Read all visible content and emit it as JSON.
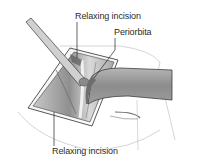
{
  "figure": {
    "type": "surgical-illustration",
    "colors": {
      "background": "#ffffff",
      "label_text": "#2b2b2b",
      "retractor_band": "#8a8a8a",
      "tissue_shadow": "#9a9a9a",
      "outline": "#3a3a3a"
    },
    "labels": [
      {
        "id": "relaxing-incision-top",
        "text": "Relaxing incision"
      },
      {
        "id": "periorbita",
        "text": "Periorbita"
      },
      {
        "id": "relaxing-incision-bottom",
        "text": "Relaxing incision"
      }
    ]
  }
}
